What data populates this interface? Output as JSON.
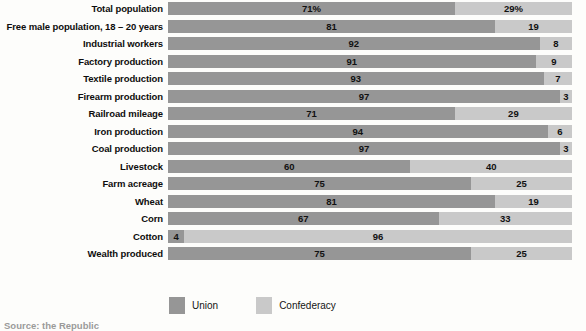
{
  "chart_data": {
    "type": "bar",
    "title": "",
    "subtitle": "",
    "xlabel": "",
    "ylabel": "",
    "orientation": "horizontal",
    "stacked": true,
    "normalized": true,
    "xlim": [
      0,
      100
    ],
    "grid": false,
    "legend_position": "bottom",
    "categories": [
      "Total population",
      "Free male population, 18 – 20 years",
      "Industrial workers",
      "Factory production",
      "Textile production",
      "Firearm production",
      "Railroad mileage",
      "Iron production",
      "Coal production",
      "Livestock",
      "Farm acreage",
      "Wheat",
      "Corn",
      "Cotton",
      "Wealth produced"
    ],
    "series": [
      {
        "name": "Union",
        "color": "#969696",
        "values": [
          71,
          81,
          92,
          91,
          93,
          97,
          71,
          94,
          97,
          60,
          75,
          81,
          67,
          4,
          75
        ],
        "labels": [
          "71%",
          "81",
          "92",
          "91",
          "93",
          "97",
          "71",
          "94",
          "97",
          "60",
          "75",
          "81",
          "67",
          "4",
          "75"
        ]
      },
      {
        "name": "Confederacy",
        "color": "#c9c9c9",
        "values": [
          29,
          19,
          8,
          9,
          7,
          3,
          29,
          6,
          3,
          40,
          25,
          19,
          33,
          96,
          25
        ],
        "labels": [
          "29%",
          "19",
          "8",
          "9",
          "7",
          "3",
          "29",
          "6",
          "3",
          "40",
          "25",
          "19",
          "33",
          "96",
          "25"
        ]
      }
    ],
    "rows": [
      {
        "label": "Total population",
        "union": 71,
        "confederacy": 29,
        "union_label": "71%",
        "confederacy_label": "29%"
      },
      {
        "label": "Free male population, 18 – 20 years",
        "union": 81,
        "confederacy": 19,
        "union_label": "81",
        "confederacy_label": "19"
      },
      {
        "label": "Industrial workers",
        "union": 92,
        "confederacy": 8,
        "union_label": "92",
        "confederacy_label": "8"
      },
      {
        "label": "Factory production",
        "union": 91,
        "confederacy": 9,
        "union_label": "91",
        "confederacy_label": "9"
      },
      {
        "label": "Textile production",
        "union": 93,
        "confederacy": 7,
        "union_label": "93",
        "confederacy_label": "7"
      },
      {
        "label": "Firearm production",
        "union": 97,
        "confederacy": 3,
        "union_label": "97",
        "confederacy_label": "3"
      },
      {
        "label": "Railroad mileage",
        "union": 71,
        "confederacy": 29,
        "union_label": "71",
        "confederacy_label": "29"
      },
      {
        "label": "Iron production",
        "union": 94,
        "confederacy": 6,
        "union_label": "94",
        "confederacy_label": "6"
      },
      {
        "label": "Coal production",
        "union": 97,
        "confederacy": 3,
        "union_label": "97",
        "confederacy_label": "3"
      },
      {
        "label": "Livestock",
        "union": 60,
        "confederacy": 40,
        "union_label": "60",
        "confederacy_label": "40"
      },
      {
        "label": "Farm acreage",
        "union": 75,
        "confederacy": 25,
        "union_label": "75",
        "confederacy_label": "25"
      },
      {
        "label": "Wheat",
        "union": 81,
        "confederacy": 19,
        "union_label": "81",
        "confederacy_label": "19"
      },
      {
        "label": "Corn",
        "union": 67,
        "confederacy": 33,
        "union_label": "67",
        "confederacy_label": "33"
      },
      {
        "label": "Cotton",
        "union": 4,
        "confederacy": 96,
        "union_label": "4",
        "confederacy_label": "96"
      },
      {
        "label": "Wealth produced",
        "union": 75,
        "confederacy": 25,
        "union_label": "75",
        "confederacy_label": "25"
      }
    ]
  },
  "legend": {
    "items": [
      {
        "label": "Union",
        "color": "#969696"
      },
      {
        "label": "Confederacy",
        "color": "#c9c9c9"
      }
    ]
  },
  "source_note": {
    "text": "Source: the Republic"
  }
}
